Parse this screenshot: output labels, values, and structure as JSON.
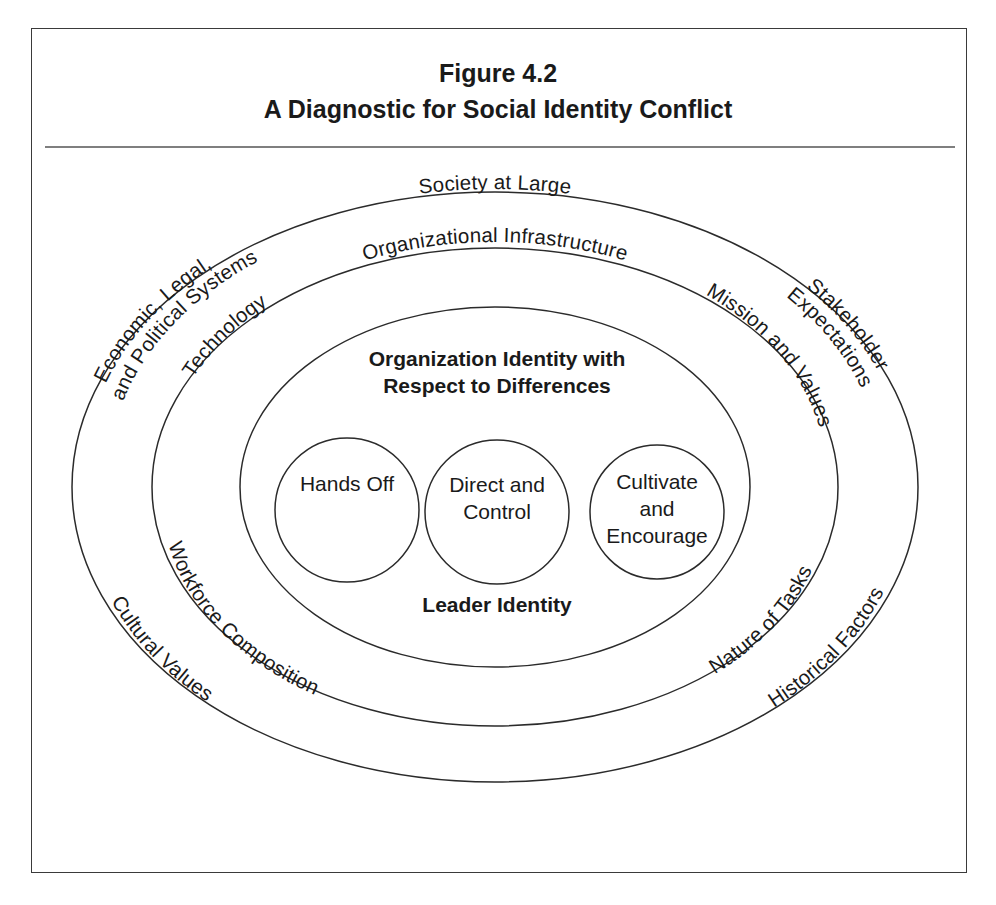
{
  "figure": {
    "number_label": "Figure 4.2",
    "title": "A Diagnostic for Social Identity Conflict"
  },
  "diagram": {
    "type": "concentric-ellipses",
    "rings": [
      {
        "id": "outer",
        "name": "society-at-large",
        "top_label": "Society at Large",
        "labels": [
          {
            "position": "top-center",
            "text": "Society at Large"
          },
          {
            "position": "upper-left",
            "text": "Economic, Legal,"
          },
          {
            "position": "upper-left-2",
            "text": "and Political Systems"
          },
          {
            "position": "upper-right",
            "text": "Stakeholder"
          },
          {
            "position": "upper-right-2",
            "text": "Expectations"
          },
          {
            "position": "lower-left",
            "text": "Cultural Values"
          },
          {
            "position": "lower-right",
            "text": "Historical Factors"
          }
        ]
      },
      {
        "id": "middle",
        "name": "organizational-infrastructure",
        "top_label": "Organizational Infrastructure",
        "labels": [
          {
            "position": "top-center",
            "text": "Organizational Infrastructure"
          },
          {
            "position": "upper-left",
            "text": "Technology"
          },
          {
            "position": "upper-right",
            "text": "Mission and Values"
          },
          {
            "position": "lower-left",
            "text": "Workforce Composition"
          },
          {
            "position": "lower-right",
            "text": "Nature of Tasks"
          }
        ]
      },
      {
        "id": "inner",
        "name": "organization-identity",
        "heading_line1": "Organization Identity with",
        "heading_line2": "Respect to Differences",
        "footer_label": "Leader Identity"
      }
    ],
    "leaf_circles": [
      {
        "id": "hands-off",
        "lines": [
          "Hands Off"
        ]
      },
      {
        "id": "direct-and-control",
        "lines": [
          "Direct and",
          "Control"
        ]
      },
      {
        "id": "cultivate-and-encourage",
        "lines": [
          "Cultivate",
          "and",
          "Encourage"
        ]
      }
    ],
    "colors": {
      "stroke": "#2b2b2b",
      "text": "#1a1a1a",
      "border": "#3a3a3a",
      "background": "#ffffff"
    }
  }
}
